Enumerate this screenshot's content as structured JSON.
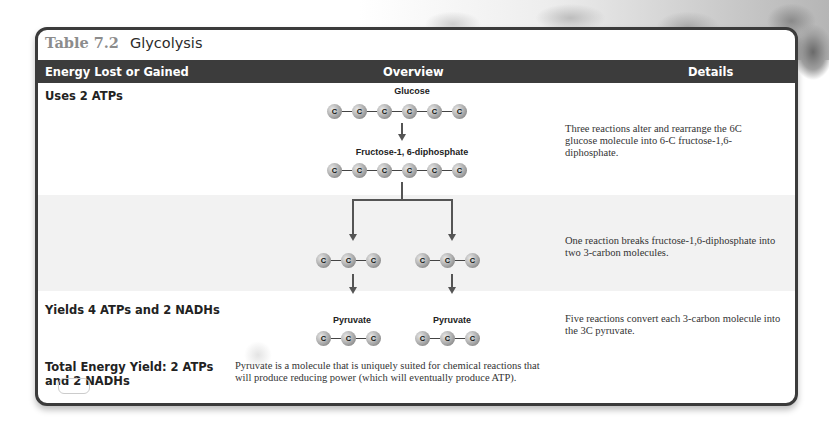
{
  "table": {
    "number": "Table 7.2",
    "title": "Glycolysis",
    "columns": [
      "Energy Lost or Gained",
      "Overview",
      "Details"
    ]
  },
  "rows": [
    {
      "energy": "Uses 2 ATPs",
      "details": "Three reactions alter and rearrange the 6C glucose molecule into 6-C fructose-1,6-diphosphate."
    },
    {
      "energy": "",
      "details": "One reaction breaks fructose-1,6-diphosphate into two 3-carbon molecules."
    },
    {
      "energy": "Yields 4 ATPs and 2 NADHs",
      "details": "Five reactions convert each 3-carbon molecule into the 3C pyruvate."
    },
    {
      "energy": "Total Energy Yield: 2 ATPs and 2 NADHs",
      "details": "Pyruvate is a molecule that is uniquely suited for chemical reactions that will produce reducing power (which will eventually produce ATP)."
    }
  ],
  "diagram": {
    "atom_label": "C",
    "glucose_label": "Glucose",
    "fructose_label": "Fructose-1, 6-diphosphate",
    "pyruvate_label": "Pyruvate",
    "glucose_carbons": 6,
    "fructose_carbons": 6,
    "three_carbon_count": 3
  }
}
